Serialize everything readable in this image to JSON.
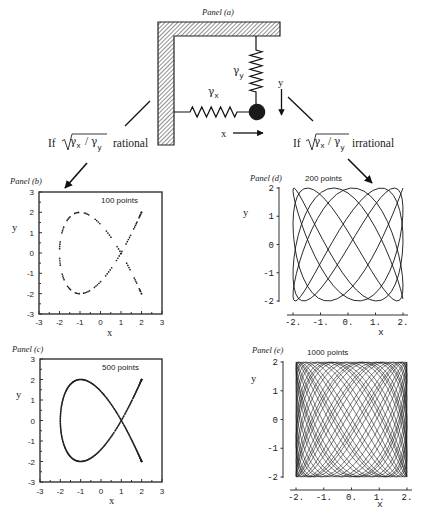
{
  "figure": {
    "panel_a": {
      "title": "Panel (a)",
      "spring_y": {
        "symbol": "γ",
        "sub": "y"
      },
      "spring_x": {
        "symbol": "γ",
        "sub": "x"
      },
      "direction_x_label": "x",
      "direction_y_label": "y"
    },
    "conditions": [
      {
        "prefix": "If",
        "num_symbol": "γ",
        "num_sub": "x",
        "slash": "/",
        "den_symbol": "γ",
        "den_sub": "y",
        "suffix": "rational"
      },
      {
        "prefix": "If",
        "num_symbol": "γ",
        "num_sub": "x",
        "slash": "/",
        "den_symbol": "γ",
        "den_sub": "y",
        "suffix": "irrational"
      }
    ]
  },
  "chart_data": [
    {
      "title": "Panel (b)",
      "type": "scatter",
      "annotation": "100 points",
      "condition": "rational",
      "xlabel": "x",
      "ylabel": "y",
      "xlim": [
        -3,
        3
      ],
      "ylim": [
        -3,
        3
      ],
      "xticks": [
        "-3",
        "-2",
        "-1",
        "0",
        "1",
        "2",
        "3"
      ],
      "xtick_values": [
        -3,
        -2,
        -1,
        0,
        1,
        2,
        3
      ],
      "yticks": [
        "3",
        "2",
        "1",
        "0",
        "-1",
        "-2",
        "-3"
      ],
      "ytick_values": [
        3,
        2,
        1,
        0,
        -1,
        -2,
        -3
      ],
      "grid": false,
      "n_points": 100,
      "curve": "Lissajous x = 2cos(2t), y = 2cos(3t)",
      "parametric": {
        "ax": 2,
        "ay": 2,
        "wx": 2,
        "wy": 3,
        "t0": 0,
        "dt": 0.137
      },
      "key_points": {
        "endpoints": [
          [
            2,
            2
          ],
          [
            2,
            -2
          ]
        ],
        "self_crossing": [
          1,
          0
        ],
        "leftmost": [
          -2,
          0
        ],
        "top": [
          -1,
          2
        ],
        "bottom": [
          -1,
          -2
        ]
      }
    },
    {
      "title": "Panel (c)",
      "type": "scatter",
      "annotation": "500 points",
      "condition": "rational",
      "xlabel": "x",
      "ylabel": "y",
      "xlim": [
        -3,
        3
      ],
      "ylim": [
        -3,
        3
      ],
      "xticks": [
        "-3",
        "-2",
        "-1",
        "0",
        "1",
        "2",
        "3"
      ],
      "xtick_values": [
        -3,
        -2,
        -1,
        0,
        1,
        2,
        3
      ],
      "yticks": [
        "3",
        "2",
        "1",
        "0",
        "-1",
        "-2",
        "-3"
      ],
      "ytick_values": [
        3,
        2,
        1,
        0,
        -1,
        -2,
        -3
      ],
      "grid": false,
      "n_points": 500,
      "curve": "Lissajous x = 2cos(2t), y = 2cos(3t)",
      "parametric": {
        "ax": 2,
        "ay": 2,
        "wx": 2,
        "wy": 3,
        "t0": 0,
        "dt": 0.137
      },
      "key_points": {
        "endpoints": [
          [
            2,
            2
          ],
          [
            2,
            -2
          ]
        ],
        "self_crossing": [
          1,
          0
        ],
        "leftmost": [
          -2,
          0
        ],
        "top": [
          -1,
          2
        ],
        "bottom": [
          -1,
          -2
        ]
      }
    },
    {
      "title": "Panel (d)",
      "type": "line",
      "annotation": "200 points",
      "condition": "irrational",
      "xlabel": "x",
      "ylabel": "y",
      "xlim": [
        -2,
        2
      ],
      "ylim": [
        -2,
        2
      ],
      "xticks": [
        "-2.",
        "-1.",
        "0.",
        "1.",
        "2."
      ],
      "xtick_values": [
        -2,
        -1,
        0,
        1,
        2
      ],
      "yticks": [
        "2",
        "1",
        "0",
        "-1",
        "-2"
      ],
      "ytick_values": [
        2,
        1,
        0,
        -1,
        -2
      ],
      "grid": false,
      "n_points": 200,
      "curve": "Lissajous x = 2cos(t), y = 2cos(1.618t), irrational ratio fills square",
      "parametric": {
        "ax": 2,
        "ay": 2,
        "wx": 1,
        "wy": 1.618034,
        "t0": 0,
        "dt": 0.126
      },
      "key_points": {
        "bounding_box": [
          [
            -2,
            -2
          ],
          [
            2,
            2
          ]
        ]
      }
    },
    {
      "title": "Panel (e)",
      "type": "line",
      "annotation": "1000 points",
      "condition": "irrational",
      "xlabel": "x",
      "ylabel": "y",
      "xlim": [
        -2,
        2
      ],
      "ylim": [
        -2,
        2
      ],
      "xticks": [
        "-2.",
        "-1.",
        "0.",
        "1.",
        "2."
      ],
      "xtick_values": [
        -2,
        -1,
        0,
        1,
        2
      ],
      "yticks": [
        "2",
        "1",
        "0",
        "-1",
        "-2"
      ],
      "ytick_values": [
        2,
        1,
        0,
        -1,
        -2
      ],
      "grid": false,
      "n_points": 1000,
      "curve": "Lissajous x = 2cos(t), y = 2cos(1.618t), irrational ratio fills square",
      "parametric": {
        "ax": 2,
        "ay": 2,
        "wx": 1,
        "wy": 1.618034,
        "t0": 0,
        "dt": 0.126
      },
      "key_points": {
        "bounding_box": [
          [
            -2,
            -2
          ],
          [
            2,
            2
          ]
        ]
      }
    }
  ]
}
